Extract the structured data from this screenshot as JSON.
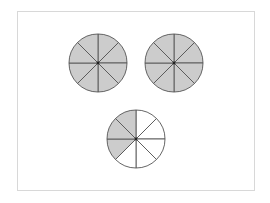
{
  "diagram": {
    "type": "fraction-circles",
    "segments_per_circle": 8,
    "colors": {
      "shaded": "#cccccc",
      "unshaded": "#ffffff",
      "stroke": "#555555",
      "frame": "#d8d8d8"
    },
    "circles": [
      {
        "id": "circle-1",
        "cx": 98,
        "cy": 63,
        "r": 29,
        "shaded_segments": [
          0,
          1,
          2,
          3,
          4,
          5,
          6,
          7
        ]
      },
      {
        "id": "circle-2",
        "cx": 174,
        "cy": 63,
        "r": 29,
        "shaded_segments": [
          0,
          1,
          2,
          3,
          4,
          5,
          6,
          7
        ]
      },
      {
        "id": "circle-3",
        "cx": 136,
        "cy": 139,
        "r": 29,
        "shaded_segments": [
          5,
          6,
          7
        ]
      }
    ]
  }
}
